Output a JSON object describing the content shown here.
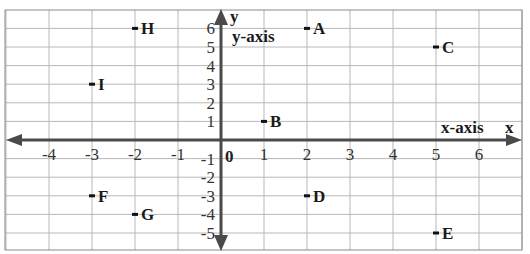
{
  "chart_data": {
    "type": "scatter",
    "title": "",
    "xlabel": "x",
    "ylabel": "y",
    "x_axis_name": "x-axis",
    "y_axis_name": "y-axis",
    "xlim": [
      -5,
      7
    ],
    "ylim": [
      -6,
      6.6
    ],
    "grid": true,
    "x_ticks": [
      -4,
      -3,
      -2,
      -1,
      0,
      1,
      2,
      3,
      4,
      5,
      6
    ],
    "y_ticks": [
      -5,
      -4,
      -3,
      -2,
      -1,
      1,
      2,
      3,
      4,
      5,
      6
    ],
    "origin_label": "0",
    "points": [
      {
        "label": "A",
        "x": 2,
        "y": 6
      },
      {
        "label": "B",
        "x": 1,
        "y": 1
      },
      {
        "label": "C",
        "x": 5,
        "y": 5
      },
      {
        "label": "D",
        "x": 2,
        "y": -3
      },
      {
        "label": "E",
        "x": 5,
        "y": -5
      },
      {
        "label": "F",
        "x": -3,
        "y": -3
      },
      {
        "label": "G",
        "x": -2,
        "y": -4
      },
      {
        "label": "H",
        "x": -2,
        "y": 6
      },
      {
        "label": "I",
        "x": -3,
        "y": 3
      }
    ],
    "colors": {
      "grid": "#b8b8b8",
      "border": "#8a8a8a",
      "axis": "#4a4a4a",
      "point": "#111111"
    }
  }
}
